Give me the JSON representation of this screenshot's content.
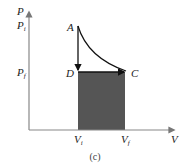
{
  "figure": {
    "caption": "(c)",
    "axes": {
      "y_label": "P",
      "x_label": "V"
    },
    "pressure_ticks": {
      "initial": {
        "base": "P",
        "sub": "i"
      },
      "final": {
        "base": "P",
        "sub": "f"
      }
    },
    "volume_ticks": {
      "initial": {
        "base": "V",
        "sub": "i"
      },
      "final": {
        "base": "V",
        "sub": "f"
      }
    },
    "points": {
      "A": "A",
      "C": "C",
      "D": "D"
    },
    "colors": {
      "axis": "#888888",
      "line": "#111111",
      "shaded_area": "#555555"
    }
  }
}
